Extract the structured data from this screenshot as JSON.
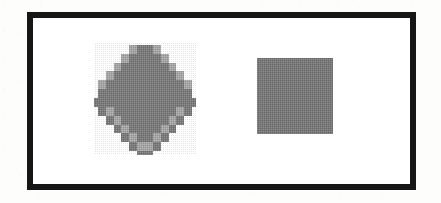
{
  "figure": {
    "caption": "",
    "background_color": "#fdfdfc",
    "frame": {
      "border_color": "#161616",
      "border_width_px": 6,
      "fill_color": "#ffffff",
      "x": 27,
      "y": 12,
      "width": 389,
      "height": 178
    },
    "shapes": [
      {
        "name": "aliased-diamond",
        "type": "diamond",
        "label": "",
        "fill_color": "#7a7a7a",
        "edge_style": "aliased-staircase",
        "center_x": 145,
        "center_y": 99,
        "half_width": 51,
        "half_height": 56,
        "step_size_px": 8
      },
      {
        "name": "solid-square",
        "type": "square",
        "label": "",
        "fill_color": "#787878",
        "edge_style": "smooth",
        "x": 257,
        "y": 58,
        "width": 76,
        "height": 76
      }
    ]
  }
}
